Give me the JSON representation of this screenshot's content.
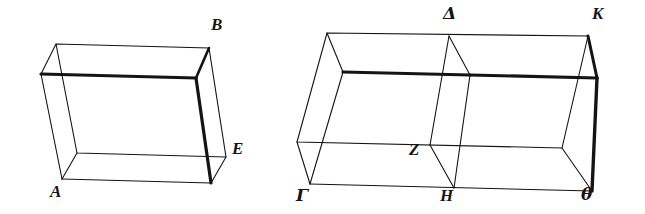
{
  "figure": {
    "name": "two-rectangular-parallelepipeds",
    "background_color": "#ffffff",
    "ink_color": "#141414",
    "stroke_width_thin": 1,
    "stroke_width_heavy": 3
  },
  "solids": [
    {
      "id": "left-solid",
      "name": "solid-AB-E",
      "labels": [
        "A",
        "B",
        "E"
      ],
      "vertices": {
        "front_bottom_left": [
          62,
          179
        ],
        "front_bottom_right": [
          211,
          183
        ],
        "front_top_right": [
          196,
          78
        ],
        "front_top_left": [
          41,
          74
        ],
        "back_bottom_left": [
          77,
          153
        ],
        "back_bottom_right": [
          226,
          157
        ],
        "back_top_right": [
          209,
          48
        ],
        "back_top_left": [
          56,
          44
        ]
      },
      "heavy_edges": [
        [
          "front_top_left",
          "front_top_right"
        ],
        [
          "front_top_right",
          "back_top_right"
        ],
        [
          "front_top_right",
          "front_bottom_right"
        ]
      ]
    },
    {
      "id": "right-solid",
      "name": "solid-GAMMA-DELTA-Z-H-THETA-K",
      "labels": [
        "Δ",
        "K",
        "Z",
        "Γ",
        "H",
        "θ"
      ],
      "vertices": {
        "front_bottom_left": [
          310,
          184
        ],
        "front_bottom_mid": [
          454,
          188
        ],
        "front_bottom_right": [
          592,
          191
        ],
        "front_top_left": [
          343,
          72
        ],
        "front_top_mid": [
          470,
          75
        ],
        "front_top_right": [
          597,
          78
        ],
        "back_bottom_left": [
          297,
          142
        ],
        "back_bottom_mid": [
          430,
          145
        ],
        "back_bottom_right": [
          562,
          148
        ],
        "back_top_left": [
          327,
          33
        ],
        "back_top_mid": [
          449,
          36
        ],
        "back_top_right": [
          588,
          36
        ]
      },
      "heavy_edges": [
        [
          "front_top_left",
          "front_top_mid"
        ],
        [
          "front_top_mid",
          "front_top_right"
        ],
        [
          "back_top_right",
          "front_top_right"
        ],
        [
          "front_top_right",
          "front_bottom_right"
        ]
      ],
      "interior_partition": {
        "name": "dividing-plane-DELTA-Z-H",
        "path": [
          "back_top_mid",
          "front_top_mid",
          "front_bottom_mid",
          "back_bottom_mid"
        ]
      }
    }
  ],
  "labels": [
    {
      "id": "label-B",
      "text": "B",
      "x": 211,
      "y": 16,
      "script": "latin",
      "solid": "left-solid"
    },
    {
      "id": "label-E",
      "text": "E",
      "x": 232,
      "y": 140,
      "script": "latin",
      "solid": "left-solid"
    },
    {
      "id": "label-A",
      "text": "A",
      "x": 50,
      "y": 183,
      "script": "latin",
      "solid": "left-solid"
    },
    {
      "id": "label-Delta",
      "text": "Δ",
      "x": 443,
      "y": 5,
      "script": "greek",
      "solid": "right-solid"
    },
    {
      "id": "label-K",
      "text": "K",
      "x": 592,
      "y": 5,
      "script": "latin",
      "solid": "right-solid"
    },
    {
      "id": "label-Z",
      "text": "Z",
      "x": 409,
      "y": 141,
      "script": "latin",
      "solid": "right-solid"
    },
    {
      "id": "label-Gamma",
      "text": "Γ",
      "x": 296,
      "y": 187,
      "script": "greek",
      "solid": "right-solid"
    },
    {
      "id": "label-H",
      "text": "H",
      "x": 440,
      "y": 187,
      "script": "latin",
      "solid": "right-solid"
    },
    {
      "id": "label-theta",
      "text": "θ",
      "x": 581,
      "y": 186,
      "script": "greek",
      "solid": "right-solid"
    }
  ]
}
